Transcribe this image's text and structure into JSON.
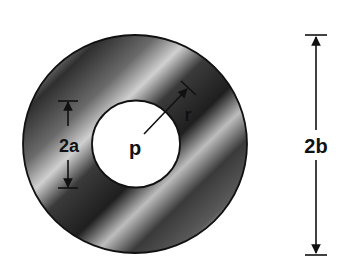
{
  "figure": {
    "labels": {
      "inner_diameter": "2a",
      "outer_diameter": "2b",
      "radius": "r",
      "center_point": "p"
    },
    "colors": {
      "background": "#ffffff",
      "annulus_dark": "#2a2a2a",
      "annulus_light": "#d8d8d8",
      "stroke": "#111111",
      "bore": "#ffffff"
    }
  }
}
